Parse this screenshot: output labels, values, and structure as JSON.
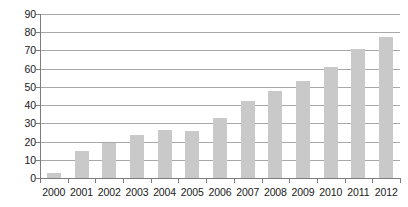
{
  "chart_data": {
    "type": "bar",
    "title": "",
    "subtitle": "",
    "xlabel": "",
    "ylabel": "",
    "categories": [
      "2000",
      "2001",
      "2002",
      "2003",
      "2004",
      "2005",
      "2006",
      "2007",
      "2008",
      "2009",
      "2010",
      "2011",
      "2012"
    ],
    "values": [
      3,
      15,
      19,
      23.5,
      26.5,
      26,
      33,
      42,
      48,
      53,
      61,
      71,
      77.5
    ],
    "ylim": [
      0,
      90
    ],
    "ytick_labels": [
      "0",
      "10",
      "20",
      "30",
      "40",
      "50",
      "60",
      "70",
      "80",
      "90"
    ],
    "ytick_values": [
      0,
      10,
      20,
      30,
      40,
      50,
      60,
      70,
      80,
      90
    ],
    "grid": "horizontal",
    "legend": "none",
    "annotations": [],
    "colors": {
      "bar_fill": "#c9c9c9",
      "gridline": "#a8a8a8",
      "axis_line": "#7d7d7d",
      "tick_label": "#1a1a1a",
      "background": "#ffffff"
    }
  }
}
